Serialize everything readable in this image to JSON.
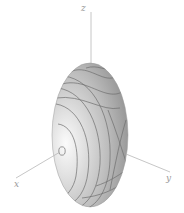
{
  "figure": {
    "type": "3d-surface",
    "surface": "ellipsoid",
    "shading": "grayscale with contour lines",
    "axes": {
      "x": {
        "label": "x"
      },
      "y": {
        "label": "y"
      },
      "z": {
        "label": "z"
      }
    },
    "colors": {
      "surface_light": "#f2f2f2",
      "surface_mid": "#c4c4c4",
      "surface_dark": "#8a8a8a",
      "contour": "#6e6e6e",
      "axis": "#b8b8b8",
      "label": "#9a9a9a"
    }
  }
}
